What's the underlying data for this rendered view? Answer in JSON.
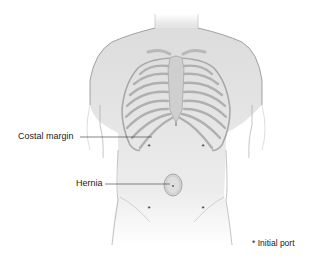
{
  "figure": {
    "labels": {
      "costal_margin": "Costal margin",
      "hernia": "Hernia"
    },
    "legend": {
      "symbol": "*",
      "text": "Initial port"
    },
    "ports": [
      {
        "position": "upper-left",
        "x": 149,
        "y": 146
      },
      {
        "position": "upper-right",
        "x": 203,
        "y": 146
      },
      {
        "position": "lower-left",
        "x": 149,
        "y": 208
      },
      {
        "position": "lower-right",
        "x": 203,
        "y": 208
      }
    ],
    "colors": {
      "skin": "#e6e6e6",
      "outline": "#9a9a9a",
      "rib": "#b5b5b5",
      "hernia": "#cfcfcf",
      "text": "#1a1a1a"
    }
  }
}
